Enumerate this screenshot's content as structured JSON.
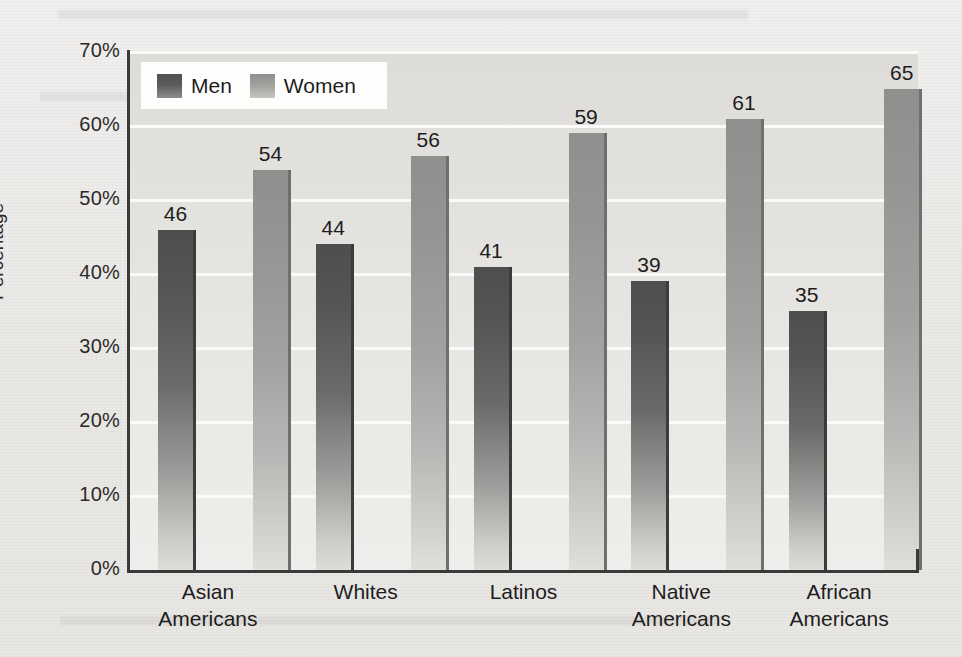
{
  "chart_data": {
    "type": "bar",
    "title": "",
    "xlabel": "",
    "ylabel": "Percentage",
    "ylim": [
      0,
      70
    ],
    "ytick_labels": [
      "70%",
      "60%",
      "50%",
      "40%",
      "30%",
      "20%",
      "10%",
      "0%"
    ],
    "ytick_values": [
      70,
      60,
      50,
      40,
      30,
      20,
      10,
      0
    ],
    "grid": true,
    "legend_position": "top-left-inside",
    "categories": [
      "Asian Americans",
      "Whites",
      "Latinos",
      "Native Americans",
      "African Americans"
    ],
    "category_lines": [
      [
        "Asian",
        "Americans"
      ],
      [
        "Whites",
        ""
      ],
      [
        "Latinos",
        ""
      ],
      [
        "Native",
        "Americans"
      ],
      [
        "African",
        "Americans"
      ]
    ],
    "series": [
      {
        "name": "Men",
        "color": "#575757",
        "values": [
          46,
          44,
          41,
          39,
          35
        ]
      },
      {
        "name": "Women",
        "color": "#9b9b99",
        "values": [
          54,
          56,
          59,
          61,
          65
        ]
      }
    ],
    "value_labels": [
      "46",
      "54",
      "44",
      "56",
      "41",
      "59",
      "39",
      "61",
      "35",
      "65"
    ]
  },
  "legend": {
    "items": [
      {
        "label": "Men",
        "swatch": "men-swatch"
      },
      {
        "label": "Women",
        "swatch": "women-swatch"
      }
    ]
  },
  "colors": {
    "men_bar": "#575757",
    "women_bar": "#9b9b99",
    "plot_background": "#e6e4e1",
    "gridline": "#fbfbfa",
    "axis": "#3a3a3a",
    "page_background": "#eceae7",
    "text": "#1d1d1d"
  }
}
